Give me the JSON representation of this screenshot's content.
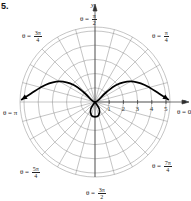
{
  "problem_number": "5.",
  "chart_data": {
    "type": "polar-line",
    "title": "",
    "center_px": [
      95,
      102
    ],
    "radial_ticks": [
      1,
      2,
      3,
      4,
      5
    ],
    "radial_tick_labels": [
      "1",
      "2",
      "3",
      "4",
      "5"
    ],
    "rmax": 5,
    "angle_grid_step": "π/12",
    "axis_labels": {
      "x": "x",
      "y": "y"
    },
    "angle_labels": [
      {
        "text": "θ = π/2",
        "theta": "π/2"
      },
      {
        "text": "θ = π/4",
        "theta": "π/4"
      },
      {
        "text": "θ = 3π/4",
        "theta": "3π/4"
      },
      {
        "text": "θ = π",
        "theta": "π"
      },
      {
        "text": "θ = 0",
        "theta": "0"
      },
      {
        "text": "θ = 5π/4",
        "theta": "5π/4"
      },
      {
        "text": "θ = 3π/2",
        "theta": "3π/2"
      },
      {
        "text": "θ = 7π/4",
        "theta": "7π/4"
      }
    ],
    "series": [
      {
        "name": "polar curve",
        "description": "Two arms extending from the origin toward θ=0 and θ=π reaching r≈5 (with arrowheads), arching upward to max height ≈1.5 near x≈±2.5, plus a small inner loop below the pole reaching r≈1 at θ=3π/2",
        "points_xy": [
          [
            -5.2,
            0.15
          ],
          [
            -4.5,
            0.6
          ],
          [
            -3.5,
            1.2
          ],
          [
            -2.5,
            1.45
          ],
          [
            -1.5,
            1.2
          ],
          [
            -0.7,
            0.6
          ],
          [
            0,
            0
          ],
          [
            0.7,
            0.6
          ],
          [
            1.5,
            1.2
          ],
          [
            2.5,
            1.45
          ],
          [
            3.5,
            1.2
          ],
          [
            4.5,
            0.6
          ],
          [
            5.2,
            0.15
          ]
        ],
        "inner_loop_xy": [
          [
            0,
            0
          ],
          [
            -0.3,
            -0.5
          ],
          [
            -0.25,
            -0.95
          ],
          [
            0,
            -1.05
          ],
          [
            0.25,
            -0.95
          ],
          [
            0.3,
            -0.5
          ],
          [
            0,
            0
          ]
        ],
        "arrows": [
          "both-ends"
        ]
      }
    ],
    "grid": true,
    "legend": null
  },
  "labels": {
    "y_axis": "y",
    "x_axis_arrow": "x",
    "pi_half": {
      "prefix": "θ =",
      "num": "π",
      "den": "2"
    },
    "pi_quarter": {
      "prefix": "θ =",
      "num": "π",
      "den": "4"
    },
    "three_pi_quarter": {
      "prefix": "θ =",
      "num": "3π",
      "den": "4"
    },
    "pi": {
      "text": "θ = π"
    },
    "zero": {
      "text": "θ = 0"
    },
    "five_pi_quarter": {
      "prefix": "θ =",
      "num": "5π",
      "den": "4"
    },
    "three_pi_half": {
      "prefix": "θ =",
      "num": "3π",
      "den": "2"
    },
    "seven_pi_quarter": {
      "prefix": "θ =",
      "num": "7π",
      "den": "4"
    }
  }
}
